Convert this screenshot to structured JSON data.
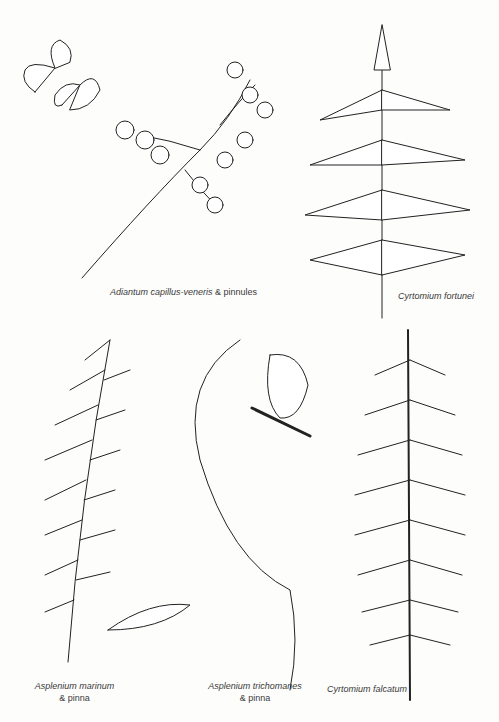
{
  "plate": {
    "background": "#fdfdfc",
    "ink": "#222222",
    "specimens": [
      {
        "name": "Adiantum capillus-veneris",
        "suffix": " & pinnules"
      },
      {
        "name": "Cyrtomium fortunei",
        "suffix": ""
      },
      {
        "name": "Asplenium marinum",
        "suffix": "& pinna"
      },
      {
        "name": "Asplenium trichomanes",
        "suffix": "& pinna"
      },
      {
        "name": "Cyrtomium falcatum",
        "suffix": ""
      }
    ]
  }
}
